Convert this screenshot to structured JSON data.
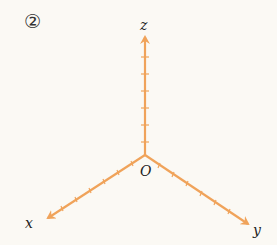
{
  "figure_number": "②",
  "axes": {
    "origin_label": "O",
    "z_label": "z",
    "x_label": "x",
    "y_label": "y",
    "color": "#f0a35a",
    "z_ticks": 6,
    "x_ticks": 8,
    "y_ticks": 8
  }
}
